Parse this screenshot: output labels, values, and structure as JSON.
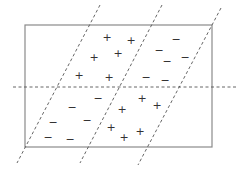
{
  "diagram": {
    "title": "",
    "colors": {
      "background": "#ffffff",
      "frame": "#8a8a8a",
      "dashed_line": "#555555",
      "marker": "#333333"
    },
    "frame": {
      "x": 25,
      "y": 25,
      "width": 187,
      "height": 122
    },
    "horizontal_divider": {
      "x1": 13,
      "y1": 87,
      "x2": 238,
      "y2": 87
    },
    "diagonal_dividers": [
      {
        "x1": 100,
        "y1": 5,
        "x2": 17,
        "y2": 163
      },
      {
        "x1": 162,
        "y1": 5,
        "x2": 80,
        "y2": 163
      },
      {
        "x1": 221,
        "y1": 8,
        "x2": 138,
        "y2": 165
      }
    ],
    "markers": [
      {
        "symbol": "+",
        "x": 107,
        "y": 37
      },
      {
        "symbol": "+",
        "x": 131,
        "y": 40
      },
      {
        "symbol": "+",
        "x": 94,
        "y": 57
      },
      {
        "symbol": "+",
        "x": 118,
        "y": 53
      },
      {
        "symbol": "+",
        "x": 79,
        "y": 75
      },
      {
        "symbol": "+",
        "x": 109,
        "y": 77
      },
      {
        "symbol": "−",
        "x": 176,
        "y": 39
      },
      {
        "symbol": "−",
        "x": 159,
        "y": 50
      },
      {
        "symbol": "−",
        "x": 167,
        "y": 61
      },
      {
        "symbol": "−",
        "x": 185,
        "y": 57
      },
      {
        "symbol": "−",
        "x": 146,
        "y": 77
      },
      {
        "symbol": "−",
        "x": 165,
        "y": 80
      },
      {
        "symbol": "−",
        "x": 98,
        "y": 98
      },
      {
        "symbol": "−",
        "x": 72,
        "y": 107
      },
      {
        "symbol": "−",
        "x": 87,
        "y": 120
      },
      {
        "symbol": "−",
        "x": 53,
        "y": 122
      },
      {
        "symbol": "−",
        "x": 48,
        "y": 137
      },
      {
        "symbol": "−",
        "x": 70,
        "y": 139
      },
      {
        "symbol": "+",
        "x": 142,
        "y": 98
      },
      {
        "symbol": "+",
        "x": 157,
        "y": 105
      },
      {
        "symbol": "+",
        "x": 122,
        "y": 109
      },
      {
        "symbol": "+",
        "x": 111,
        "y": 127
      },
      {
        "symbol": "+",
        "x": 140,
        "y": 131
      },
      {
        "symbol": "+",
        "x": 124,
        "y": 137
      }
    ]
  }
}
